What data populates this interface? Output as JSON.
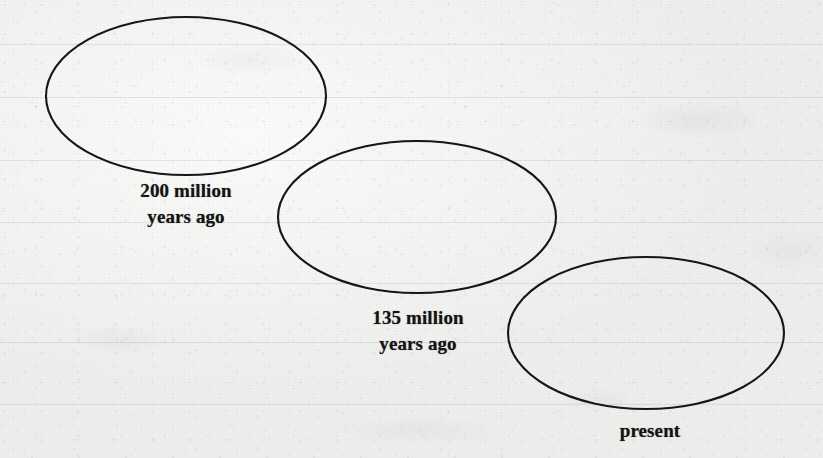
{
  "document": {
    "kind": "scanned-textbook-figure",
    "description": "Three overlapping-cascade ellipses representing the Earth landmass at three geologic times",
    "paper_color": "#f3f3f1",
    "ink_color": "#141414"
  },
  "figure": {
    "stroke_color": "#161616",
    "stroke_width": 2.1,
    "shapes": [
      {
        "id": "ellipse-200-million",
        "name": "landmass-ellipse-1",
        "cx": 186,
        "cy": 96,
        "rx": 140,
        "ry": 79
      },
      {
        "id": "ellipse-135-million",
        "name": "landmass-ellipse-2",
        "cx": 417,
        "cy": 217,
        "rx": 139,
        "ry": 76
      },
      {
        "id": "ellipse-present",
        "name": "landmass-ellipse-3",
        "cx": 646,
        "cy": 333,
        "rx": 138,
        "ry": 76
      }
    ],
    "labels": [
      {
        "id": "label-200-million",
        "name": "time-label-200-million",
        "lines": [
          "200 million",
          "years ago"
        ],
        "x": 120,
        "y": 178,
        "width": 132,
        "align": "center"
      },
      {
        "id": "label-135-million",
        "name": "time-label-135-million",
        "lines": [
          "135 million",
          "years ago"
        ],
        "x": 352,
        "y": 305,
        "width": 132,
        "align": "center"
      },
      {
        "id": "label-present",
        "name": "time-label-present",
        "lines": [
          "present"
        ],
        "x": 606,
        "y": 418,
        "width": 88,
        "align": "center"
      }
    ],
    "bleed_lines_y": [
      44,
      97,
      160,
      222,
      283,
      342,
      404
    ]
  },
  "chart_data": {
    "type": "diagram",
    "title": "",
    "sequence": [
      {
        "period": "200 million years ago",
        "order": 1
      },
      {
        "period": "135 million years ago",
        "order": 2
      },
      {
        "period": "present",
        "order": 3
      }
    ]
  }
}
